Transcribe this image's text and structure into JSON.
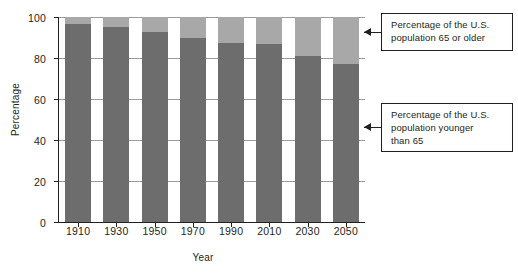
{
  "chart_data": {
    "type": "bar",
    "stacked": true,
    "title": "",
    "subtitle": "",
    "xlabel": "Year",
    "ylabel": "Percentage",
    "categories": [
      "1910",
      "1930",
      "1950",
      "1970",
      "1990",
      "2010",
      "2030",
      "2050"
    ],
    "series": [
      {
        "name": "Percentage of the U.S. population younger than 65",
        "color": "#6d6d6d",
        "values": [
          96.5,
          95,
          92.5,
          90,
          87.5,
          87,
          81,
          77
        ]
      },
      {
        "name": "Percentage of the U.S. population 65 or older",
        "color": "#a8a8a8",
        "values": [
          3.5,
          5,
          7.5,
          10,
          12.5,
          13,
          19,
          23
        ]
      }
    ],
    "ylim": [
      0,
      100
    ],
    "yticks": [
      0,
      20,
      40,
      60,
      80,
      100
    ],
    "ytick_labels": [
      "0",
      "20",
      "40",
      "60",
      "80",
      "100"
    ],
    "grid": true,
    "grid_axis": "y",
    "legend": "none",
    "annotations": [
      {
        "id": "older",
        "lines": [
          "Percentage of the U.S.",
          "population 65 or older"
        ],
        "points_to": "upper-segment"
      },
      {
        "id": "younger",
        "lines": [
          "Percentage of the U.S.",
          "population younger",
          "than 65"
        ],
        "points_to": "lower-segment"
      }
    ]
  },
  "colors": {
    "lower_segment": "#6d6d6d",
    "upper_segment": "#a8a8a8",
    "axis": "#231f20",
    "gridline": "#9b9b9b",
    "background": "#ffffff"
  }
}
